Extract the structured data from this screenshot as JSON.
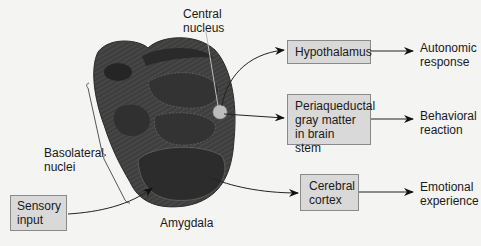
{
  "labels": {
    "central_nucleus": [
      "Central",
      "nucleus"
    ],
    "basolateral_nuclei": [
      "Basolateral",
      "nuclei"
    ],
    "amygdala": "Amygdala"
  },
  "boxes": {
    "sensory_input": [
      "Sensory",
      "input"
    ],
    "hypothalamus": [
      "Hypothalamus"
    ],
    "periaqueductal": [
      "Periaqueductal",
      "gray matter",
      "in brain stem"
    ],
    "cerebral_cortex": [
      "Cerebral",
      "cortex"
    ]
  },
  "outputs": {
    "autonomic": [
      "Autonomic",
      "response"
    ],
    "behavioral": [
      "Behavioral",
      "reaction"
    ],
    "emotional": [
      "Emotional",
      "experience"
    ]
  },
  "colors": {
    "amygdala_dark": "#2e2e2e",
    "amygdala_mid": "#474747",
    "central_nucleus_fill": "#bdbdbd",
    "box_fill": "#d9d9d9",
    "box_border": "#8a8a8a",
    "background": "#f4f4f2"
  }
}
